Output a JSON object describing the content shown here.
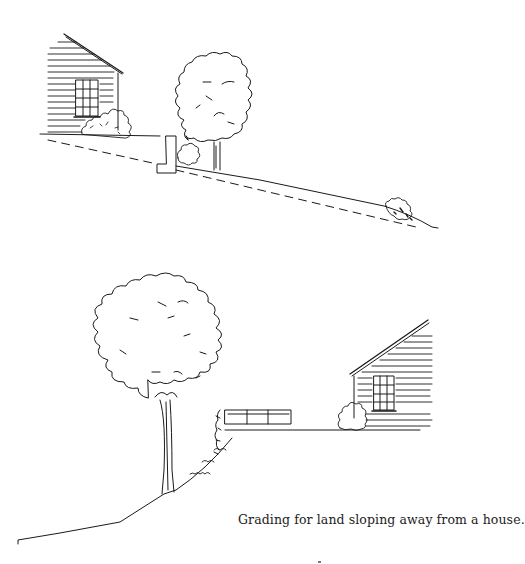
{
  "page": {
    "background": "#ffffff",
    "ink_color": "#1a1a1a"
  },
  "illustrations": [
    {
      "id": "top",
      "description": "House on left at top of slope, low retaining wall, shrubs, deciduous tree, ground sloping down to right with dashed original grade line and shrub at bottom right"
    },
    {
      "id": "bottom",
      "description": "Large tree on slope at left, retaining wall with planting on bank, level terrace leading to house on right with shrub by door"
    }
  ],
  "caption": {
    "text": "Grading for land sloping away from a house."
  }
}
